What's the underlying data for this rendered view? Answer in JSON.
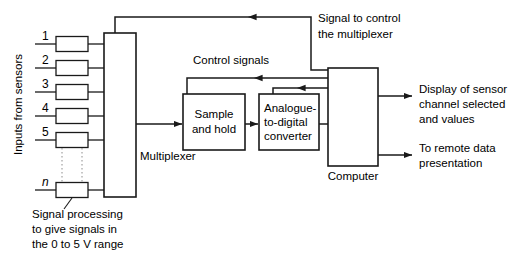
{
  "diagram": {
    "side_label": "Inputs from sensors",
    "channels": [
      {
        "id": "1",
        "label": "1"
      },
      {
        "id": "2",
        "label": "2"
      },
      {
        "id": "3",
        "label": "3"
      },
      {
        "id": "4",
        "label": "4"
      },
      {
        "id": "5",
        "label": "5"
      },
      {
        "id": "n",
        "label": "n"
      }
    ],
    "blocks": {
      "multiplexer": {
        "label": "Multiplexer"
      },
      "sample_and_hold": {
        "line1": "Sample",
        "line2": "and hold"
      },
      "adc": {
        "line1": "Analogue-",
        "line2": "to-digital",
        "line3": "converter"
      },
      "computer": {
        "label": "Computer"
      }
    },
    "annotations": {
      "control_signals": "Control signals",
      "signal_to_control": {
        "line1": "Signal to control",
        "line2": "the multiplexer"
      },
      "signal_processing": {
        "line1": "Signal processing",
        "line2": "to give signals in",
        "line3": "the 0 to 5 V range"
      }
    },
    "outputs": [
      {
        "line1": "Display of sensor",
        "line2": "channel selected",
        "line3": "and values"
      },
      {
        "line1": "To remote data",
        "line2": "presentation",
        "line3": ""
      }
    ],
    "colors": {
      "line": "#1a1a1a",
      "text": "#000000",
      "background": "#ffffff",
      "dotted": "#8d8d8d"
    }
  }
}
